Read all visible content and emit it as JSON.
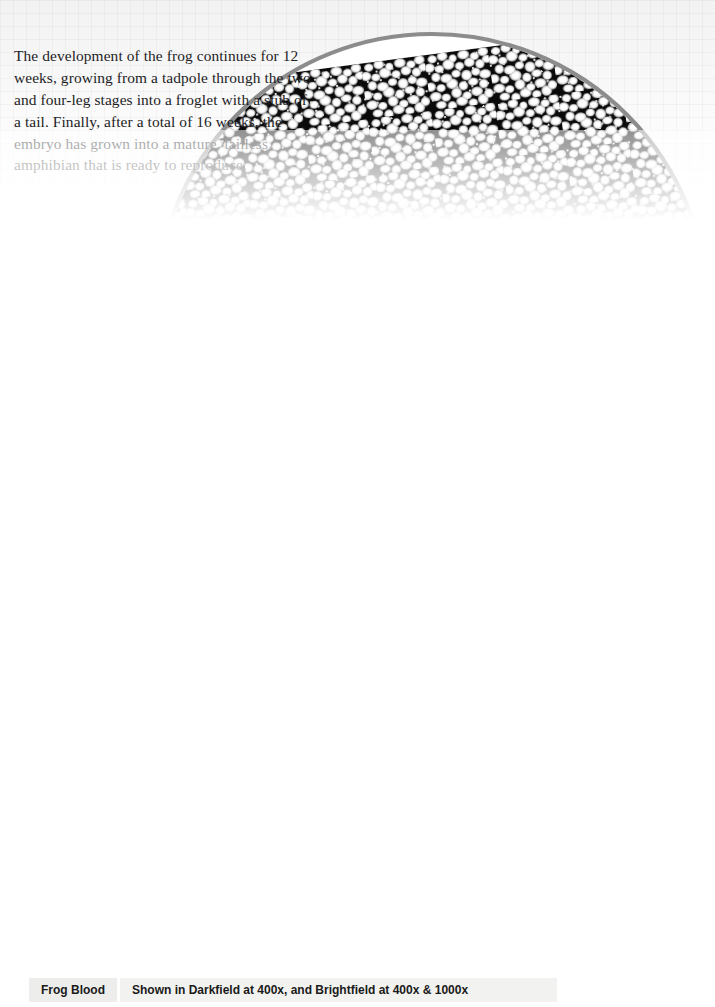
{
  "page": {
    "background_color": "#fdfdfd",
    "accent_gray": "#8a8a8a"
  },
  "intro": {
    "text": "The development of the frog continues for 12 weeks, growing from a tadpole through the two and four-leg stages into a froglet with a stub of a tail. Finally, after a total of 16 weeks, the embryo has grown into a mature, tailless amphibian that is ready to reproduce."
  },
  "blood_paragraph": {
    "part1": "Frog blood is very similar to most other vertebrates’ blood: it still carries oxygen in the ",
    "highlight1": "hemoglobin",
    "highlight1_color": "#a9a0a2",
    "part2": " molecule and has a “filled-in-donut” shape. Other creatures have a variety of oxygen-carrying molecules such as haemocyanin, ",
    "highlight2": "haemorythrin",
    "highlight2_color": "#a8a3ad",
    "part3": ", and ",
    "highlight3": "chlorocruorin",
    "highlight3_color": "#b9bdb6",
    "part4": " that make their blood different colors. Green blood isn’t limited to science fiction!"
  },
  "skin_inset": {
    "caption_title": "Frog Skin",
    "caption_magnification": "1000x",
    "title_bg": "#8a8a8a",
    "mag_bg": "#9a9a9a",
    "ring_color": "#8c8c8c"
  },
  "blood_strip": {
    "caption_title": "Frog Blood",
    "caption_description": "Shown in Darkfield at 400x, and Brightfield at 400x & 1000x",
    "caption_title_bg": "#ededeb",
    "caption_desc_bg": "#f2f2f0",
    "panels": [
      {
        "name": "darkfield-400x",
        "technique": "Darkfield",
        "magnification": "400x"
      },
      {
        "name": "brightfield-400x",
        "technique": "Brightfield",
        "magnification": "400x"
      },
      {
        "name": "brightfield-1000x",
        "technique": "Brightfield",
        "magnification": "1000x"
      }
    ]
  },
  "figures": {
    "tadpole_label": "tadpole",
    "frog_label": "adult leopard frog",
    "skin_micrograph_label": "frog skin micrograph"
  }
}
